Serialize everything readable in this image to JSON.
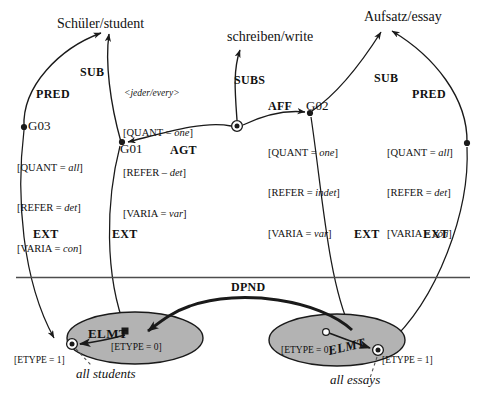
{
  "diagram": {
    "colors": {
      "stroke": "#1a1a1a",
      "ellipse_fill": "#b3b3b3",
      "background": "#ffffff",
      "divider": "#4d4d4d"
    },
    "concepts": [
      {
        "id": "student",
        "label": "Schüler/student"
      },
      {
        "id": "write",
        "label": "schreiben/write"
      },
      {
        "id": "essay",
        "label": "Aufsatz/essay"
      }
    ],
    "nodes": [
      {
        "id": "G03",
        "label": "G03",
        "angle_label": "",
        "attrs": [
          {
            "key": "QUANT",
            "op": "=",
            "value": "all"
          },
          {
            "key": "REFER",
            "op": "=",
            "value": "det"
          },
          {
            "key": "VARIA",
            "op": "=",
            "value": "con"
          }
        ]
      },
      {
        "id": "G01",
        "label": "G01",
        "angle_label": "<jeder/every>",
        "attrs": [
          {
            "key": "QUANT",
            "op": "=",
            "value": "one"
          },
          {
            "key": "REFER",
            "op": "–",
            "value": "det"
          },
          {
            "key": "VARIA",
            "op": "=",
            "value": "var"
          }
        ]
      },
      {
        "id": "G02",
        "label": "G02",
        "angle_label": "",
        "attrs": [
          {
            "key": "QUANT",
            "op": "=",
            "value": "one"
          },
          {
            "key": "REFER",
            "op": "=",
            "value": "indet"
          },
          {
            "key": "VARIA",
            "op": "=",
            "value": "var"
          }
        ]
      },
      {
        "id": "G04",
        "label": "",
        "angle_label": "",
        "attrs": [
          {
            "key": "QUANT",
            "op": "=",
            "value": "all"
          },
          {
            "key": "REFER",
            "op": "=",
            "value": "det"
          },
          {
            "key": "VARIA",
            "op": "=",
            "value": "con"
          }
        ]
      }
    ],
    "relations": [
      {
        "id": "pred-left",
        "label": "PRED"
      },
      {
        "id": "sub-left",
        "label": "SUB"
      },
      {
        "id": "agt",
        "label": "AGT"
      },
      {
        "id": "subs",
        "label": "SUBS"
      },
      {
        "id": "aff",
        "label": "AFF"
      },
      {
        "id": "sub-right",
        "label": "SUB"
      },
      {
        "id": "pred-right",
        "label": "PRED"
      },
      {
        "id": "ext-1",
        "label": "EXT"
      },
      {
        "id": "ext-2",
        "label": "EXT"
      },
      {
        "id": "ext-3",
        "label": "EXT"
      },
      {
        "id": "ext-4",
        "label": "EXT"
      },
      {
        "id": "dpnd",
        "label": "DPND"
      },
      {
        "id": "elmt-left",
        "label": "ELMT"
      },
      {
        "id": "elmt-right",
        "label": "ELMT"
      }
    ],
    "extension_sets": [
      {
        "id": "students-set",
        "set_etype": "[ETYPE = 0]",
        "element_etype": "[ETYPE = 1]",
        "gloss": "all students"
      },
      {
        "id": "essays-set",
        "set_etype": "[ETYPE = 0]",
        "element_etype": "[ETYPE = 1]",
        "gloss": "all essays"
      }
    ]
  }
}
